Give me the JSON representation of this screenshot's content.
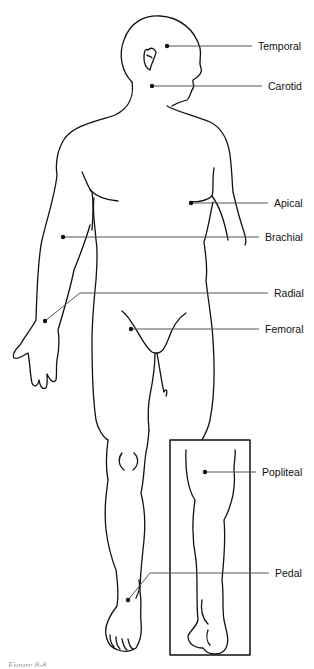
{
  "figure": {
    "caption": "Figure 8-8",
    "line_color": "#111111",
    "leader_color": "#555555",
    "labels": [
      {
        "id": "temporal",
        "text": "Temporal",
        "label_x": 258,
        "label_y": 12,
        "dot": [
          167,
          46
        ],
        "line_y": 46
      },
      {
        "id": "carotid",
        "text": "Carotid",
        "label_x": 268,
        "label_y": 80,
        "dot": [
          152,
          86
        ],
        "line_y": 86
      },
      {
        "id": "apical",
        "text": "Apical",
        "label_x": 274,
        "label_y": 198,
        "dot": [
          191,
          203
        ],
        "line_y": 203
      },
      {
        "id": "brachial",
        "text": "Brachial",
        "label_x": 265,
        "label_y": 233,
        "dot": [
          63,
          237
        ],
        "line_y": 237
      },
      {
        "id": "radial",
        "text": "Radial",
        "label_x": 274,
        "label_y": 289,
        "dot": [
          45,
          321
        ],
        "line_y": 293
      },
      {
        "id": "femoral",
        "text": "Femoral",
        "label_x": 265,
        "label_y": 325,
        "dot": [
          131,
          329
        ],
        "line_y": 329
      },
      {
        "id": "popliteal",
        "text": "Popliteal",
        "label_x": 262,
        "label_y": 468,
        "dot": [
          205,
          472
        ],
        "line_y": 472
      },
      {
        "id": "pedal",
        "text": "Pedal",
        "label_x": 275,
        "label_y": 569,
        "dot": [
          128,
          600
        ],
        "line_y": 573
      }
    ]
  }
}
